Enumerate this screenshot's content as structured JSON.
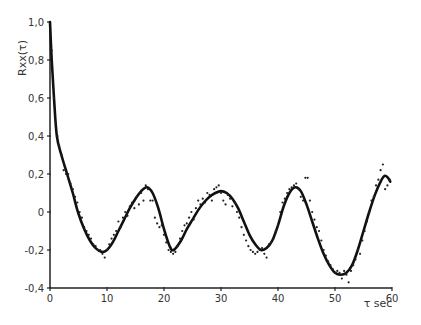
{
  "chart_data": {
    "type": "line",
    "title": "",
    "xlabel": "τ sec",
    "ylabel": "Rxx(τ)",
    "xlim": [
      0,
      60
    ],
    "ylim": [
      -0.4,
      1.0
    ],
    "x_ticks": [
      0,
      10,
      20,
      30,
      40,
      50,
      60
    ],
    "y_ticks": [
      -0.4,
      -0.2,
      0,
      0.2,
      0.4,
      0.6,
      0.8,
      1.0
    ],
    "x_tick_labels": [
      "0",
      "10",
      "20",
      "30",
      "40",
      "50",
      "60"
    ],
    "y_tick_labels": [
      "-0,4",
      "-0,2",
      "0",
      "0,2",
      "0,4",
      "0,6",
      "0,8",
      "1,0"
    ],
    "grid": false,
    "legend": null,
    "series": [
      {
        "name": "smoothed autocorrelation",
        "style": "solid-line",
        "x": [
          0,
          0.3,
          0.7,
          1.2,
          2,
          3,
          4,
          4.9,
          6,
          7,
          8,
          9.1,
          10,
          11,
          12,
          13,
          14,
          15,
          16,
          17,
          18,
          19,
          20,
          21,
          21.7,
          23,
          24,
          25,
          26,
          27,
          28,
          29,
          30,
          31,
          32,
          33,
          34,
          35,
          36,
          37,
          38,
          39,
          40,
          41,
          42,
          43,
          44,
          45,
          46,
          47,
          48,
          49,
          50,
          51,
          52,
          53,
          54,
          55,
          56,
          57,
          58,
          58.7,
          59.3,
          59.7
        ],
        "values": [
          1.0,
          0.8,
          0.6,
          0.4,
          0.3,
          0.2,
          0.1,
          0.0,
          -0.09,
          -0.15,
          -0.19,
          -0.21,
          -0.2,
          -0.16,
          -0.1,
          -0.04,
          0.02,
          0.07,
          0.11,
          0.13,
          0.1,
          0.02,
          -0.09,
          -0.18,
          -0.2,
          -0.15,
          -0.09,
          -0.04,
          0.01,
          0.05,
          0.08,
          0.1,
          0.11,
          0.1,
          0.07,
          0.02,
          -0.05,
          -0.12,
          -0.17,
          -0.2,
          -0.19,
          -0.15,
          -0.07,
          0.03,
          0.1,
          0.13,
          0.11,
          0.04,
          -0.05,
          -0.14,
          -0.22,
          -0.28,
          -0.32,
          -0.33,
          -0.32,
          -0.28,
          -0.2,
          -0.1,
          0.0,
          0.09,
          0.16,
          0.19,
          0.18,
          0.16
        ]
      },
      {
        "name": "measured points",
        "style": "dots",
        "x": [
          0.3,
          0.7,
          1,
          1.3,
          1.6,
          2,
          2.4,
          2.8,
          3.2,
          3.6,
          4,
          4.4,
          4.8,
          5.2,
          5.6,
          6,
          6.4,
          6.8,
          7.2,
          7.6,
          8,
          8.4,
          8.8,
          9.2,
          9.6,
          10,
          10.4,
          10.8,
          11.2,
          11.6,
          12,
          12.4,
          12.8,
          13.2,
          13.6,
          14,
          14.4,
          14.8,
          15.2,
          15.6,
          16,
          16.4,
          16.8,
          17.2,
          17.6,
          18,
          18.4,
          18.8,
          19.2,
          19.6,
          20,
          20.4,
          20.8,
          21.2,
          21.6,
          22,
          22.4,
          22.8,
          23.2,
          23.6,
          24,
          24.4,
          24.8,
          25.2,
          25.6,
          26,
          26.4,
          26.8,
          27.2,
          27.6,
          28,
          28.4,
          28.8,
          29.2,
          29.6,
          30,
          30.4,
          30.8,
          31.2,
          31.6,
          32,
          32.4,
          32.8,
          33.2,
          33.6,
          34,
          34.4,
          34.8,
          35.2,
          35.6,
          36,
          36.4,
          36.8,
          37.2,
          37.6,
          38,
          38.4,
          38.8,
          39.2,
          39.6,
          40,
          40.4,
          40.8,
          41.2,
          41.6,
          42,
          42.4,
          42.8,
          43.2,
          43.6,
          44,
          44.4,
          44.8,
          45.2,
          45.6,
          46,
          46.4,
          46.8,
          47.2,
          47.6,
          48,
          48.4,
          48.8,
          49.2,
          49.6,
          50,
          50.4,
          50.8,
          51.2,
          51.6,
          52,
          52.4,
          52.8,
          53.2,
          53.6,
          54,
          54.4,
          54.8,
          55.2,
          55.6,
          56,
          56.4,
          56.8,
          57.2,
          57.6,
          58,
          58.4,
          58.8,
          59.2,
          59.6
        ],
        "values": [
          0.85,
          0.6,
          0.47,
          0.4,
          0.35,
          0.3,
          0.22,
          0.2,
          0.2,
          0.15,
          0.12,
          0.08,
          0.05,
          0.0,
          -0.03,
          -0.08,
          -0.1,
          -0.12,
          -0.14,
          -0.17,
          -0.18,
          -0.2,
          -0.2,
          -0.22,
          -0.24,
          -0.2,
          -0.17,
          -0.14,
          -0.12,
          -0.1,
          -0.05,
          -0.08,
          -0.03,
          0.0,
          -0.02,
          0.03,
          0.05,
          0.02,
          0.08,
          0.04,
          0.1,
          0.06,
          0.14,
          0.12,
          0.06,
          0.06,
          -0.03,
          -0.06,
          -0.08,
          -0.07,
          -0.12,
          -0.16,
          -0.2,
          -0.21,
          -0.22,
          -0.21,
          -0.18,
          -0.14,
          -0.1,
          -0.07,
          -0.06,
          -0.03,
          0.0,
          -0.04,
          0.02,
          0.06,
          0.04,
          0.07,
          0.05,
          0.1,
          0.09,
          0.06,
          0.12,
          0.13,
          0.14,
          0.1,
          0.06,
          0.04,
          0.09,
          0.07,
          0.03,
          0.05,
          0.0,
          -0.03,
          -0.08,
          -0.12,
          -0.15,
          -0.18,
          -0.2,
          -0.21,
          -0.22,
          -0.21,
          -0.2,
          -0.19,
          -0.22,
          -0.24,
          -0.17,
          -0.16,
          -0.14,
          -0.1,
          -0.07,
          0.0,
          0.05,
          0.07,
          0.1,
          0.12,
          0.13,
          0.14,
          0.15,
          0.12,
          0.08,
          0.06,
          0.18,
          0.18,
          0.06,
          0.0,
          -0.04,
          -0.08,
          -0.1,
          -0.15,
          -0.2,
          -0.23,
          -0.26,
          -0.28,
          -0.3,
          -0.32,
          -0.31,
          -0.32,
          -0.35,
          -0.31,
          -0.33,
          -0.37,
          -0.31,
          -0.28,
          -0.25,
          -0.2,
          -0.22,
          -0.15,
          -0.1,
          -0.05,
          0.0,
          0.06,
          0.08,
          0.14,
          0.17,
          0.22,
          0.25,
          0.12,
          0.14,
          0.17
        ]
      }
    ]
  }
}
